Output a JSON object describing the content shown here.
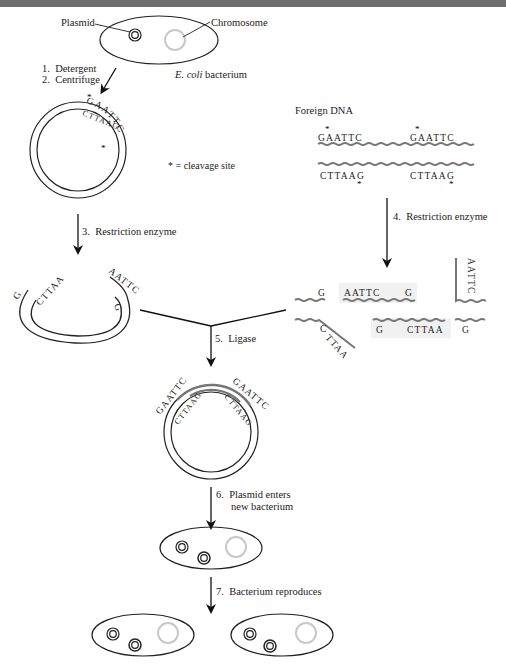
{
  "figure": {
    "labels": {
      "plasmid": "Plasmid",
      "chromosome": "Chromosome",
      "bacterium": "E. coli",
      "bacterium_suffix": " bacterium",
      "foreign_dna": "Foreign DNA",
      "cleavage_note": "* = cleavage site"
    },
    "steps": [
      {
        "n": "1.",
        "text": "Detergent"
      },
      {
        "n": "2.",
        "text": "Centrifuge"
      },
      {
        "n": "3.",
        "text": "Restriction enzyme"
      },
      {
        "n": "4.",
        "text": "Restriction enzyme"
      },
      {
        "n": "5.",
        "text": "Ligase"
      },
      {
        "n": "6.",
        "text": "Plasmid enters",
        "text2": "new bacterium"
      },
      {
        "n": "7.",
        "text": "Bacterium reproduces"
      }
    ],
    "sequences": {
      "top_strand": "GAATTC",
      "bottom_strand": "CTTAAG",
      "sticky_top": "AATTC",
      "sticky_bottom": "CTTAA",
      "g": "G",
      "c": "C"
    },
    "colors": {
      "ink": "#222222",
      "chromosome": "#c8c8c8",
      "foreign_dna": "#777777",
      "topbar": "#6e6e6e",
      "highlight": "#f1f1f1"
    }
  }
}
